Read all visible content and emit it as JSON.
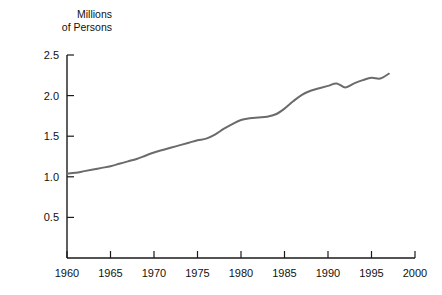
{
  "chart_data": {
    "type": "line",
    "title": "",
    "ylabel": "Millions\nof Persons",
    "ylabel_line1": "Millions",
    "ylabel_line2": "of Persons",
    "xlabel": "",
    "xlim": [
      1960,
      2000
    ],
    "ylim": [
      0,
      2.5
    ],
    "grid": false,
    "legend": null,
    "line_color": "#6b6b6b",
    "axis_color": "#1a1a1a",
    "y_ticks": [
      "0.5",
      "1.0",
      "1.5",
      "2.0",
      "2.5"
    ],
    "y_tick_values": [
      0.5,
      1.0,
      1.5,
      2.0,
      2.5
    ],
    "x_ticks": [
      "1960",
      "1965",
      "1970",
      "1975",
      "1980",
      "1985",
      "1990",
      "1995",
      "2000"
    ],
    "x_tick_values": [
      1960,
      1965,
      1970,
      1975,
      1980,
      1985,
      1990,
      1995,
      2000
    ],
    "series": [
      {
        "name": "Persons",
        "x": [
          1960,
          1961,
          1962,
          1963,
          1964,
          1965,
          1966,
          1967,
          1968,
          1969,
          1970,
          1971,
          1972,
          1973,
          1974,
          1975,
          1976,
          1977,
          1978,
          1979,
          1980,
          1981,
          1982,
          1983,
          1984,
          1985,
          1986,
          1987,
          1988,
          1989,
          1990,
          1991,
          1992,
          1993,
          1994,
          1995,
          1996,
          1997
        ],
        "values": [
          1.04,
          1.05,
          1.07,
          1.09,
          1.11,
          1.13,
          1.16,
          1.19,
          1.22,
          1.26,
          1.3,
          1.33,
          1.36,
          1.39,
          1.42,
          1.45,
          1.47,
          1.52,
          1.59,
          1.65,
          1.7,
          1.72,
          1.73,
          1.74,
          1.77,
          1.84,
          1.93,
          2.01,
          2.06,
          2.09,
          2.12,
          2.15,
          2.1,
          2.15,
          2.19,
          2.22,
          2.21,
          2.27
        ]
      }
    ],
    "caption_partial": ""
  },
  "figure": {
    "background": "#ffffff"
  }
}
